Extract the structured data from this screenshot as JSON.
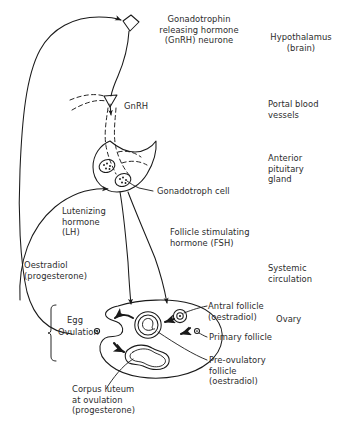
{
  "diagram": {
    "type": "biological-schematic",
    "background_color": "#ffffff",
    "ink_color": "#1a1a1a",
    "text_color": "#2b2b2b"
  },
  "region_labels": {
    "hypothalamus": "Hypothalamus\n(brain)",
    "portal_vessels": "Portal blood\nvessels",
    "anterior_pituitary": "Anterior\npituitary\ngland",
    "systemic_circulation": "Systemic\ncirculation",
    "ovary": "Ovary"
  },
  "structure_labels": {
    "gnrh_neurone": "Gonadotrophin\nreleasing hormone\n(GnRH) neurone",
    "gnrh": "GnRH",
    "gonadotroph_cell": "Gonadotroph cell",
    "lh": "Lutenizing\nhormone\n(LH)",
    "fsh": "Follicle stimulating\nhormone (FSH)",
    "oestradiol": "Oestradiol\n(progesterone)",
    "egg": "Egg",
    "ovulation": "Ovulation",
    "antral_follicle": "Antral follicle\n(oestradiol)",
    "primary_follicle": "Primary follicle",
    "preovulatory_follicle": "Pre-ovulatory\nfollicle\n(oestradiol)",
    "corpus_luteum": "Corpus luteum\nat ovulation\n(progesterone)"
  },
  "icon_names": {
    "neurone_soma": "diamond-soma-icon",
    "axon_terminal": "triangle-terminal-icon",
    "pituitary_body": "pear-shape-icon",
    "gonadotroph_cells": "oval-cell-icon",
    "ovary_body": "ellipse-ovary-icon",
    "egg_cell": "small-circle-icon",
    "bracket": "vertical-bracket-icon"
  }
}
